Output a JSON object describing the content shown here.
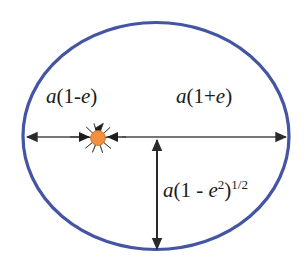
{
  "diagram": {
    "background_color": "#ffffff",
    "ellipse": {
      "name": "orbit-ellipse",
      "stroke_color": "#4455a3",
      "stroke_width": 3.2,
      "fill": "none",
      "center_x": 156,
      "center_y": 136,
      "radius_x": 134,
      "radius_y": 114
    },
    "sun": {
      "name": "sun-marker",
      "disc_color": "#f2913d",
      "disc_edge_color": "#c9702a",
      "ray_color": "#241c17",
      "center_x": 98,
      "center_y": 138,
      "disc_radius": 7.4,
      "ray_outer_radius": 15.5,
      "ray_count": 10
    },
    "axes": {
      "major_axis_line": {
        "name": "major-axis-line",
        "color": "#4a4a4a",
        "width": 1.7,
        "y": 137,
        "x_start": 24,
        "x_end": 289
      },
      "minor_axis_arrow": {
        "name": "semi-minor-axis-arrow",
        "color": "#2b2b2b",
        "width": 1.9,
        "x": 157,
        "y_top": 138,
        "y_bottom": 249
      }
    },
    "labels": {
      "periapsis": {
        "name": "label-periapsis",
        "text": "a(1-e)",
        "parts": {
          "var_a": "a",
          "open": "(1-",
          "var_e": "e",
          "close": ")"
        }
      },
      "apoapsis": {
        "name": "label-apoapsis",
        "text": "a(1+e)",
        "parts": {
          "var_a": "a",
          "open": "(1+",
          "var_e": "e",
          "close": ")"
        }
      },
      "semiminor": {
        "name": "label-semi-minor-axis",
        "text": "a(1 - e2)1/2",
        "parts": {
          "var_a": "a",
          "open": "(1 - ",
          "var_e": "e",
          "sup_two": "2",
          "close": ")",
          "sup_half": "1/2"
        }
      }
    }
  }
}
